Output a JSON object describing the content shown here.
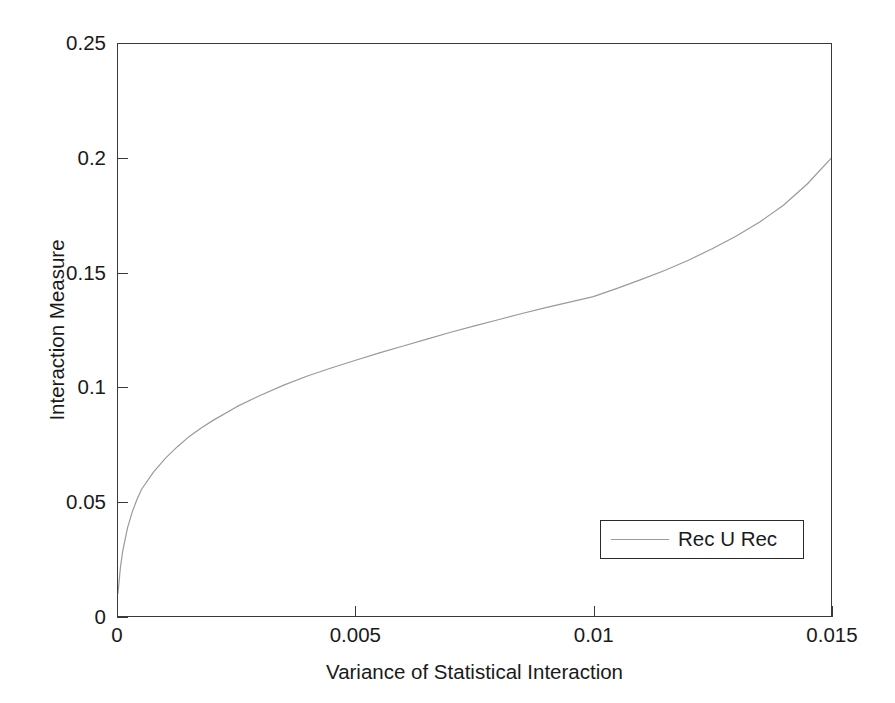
{
  "chart_data": {
    "type": "line",
    "title": "",
    "subtitle": "",
    "xlabel": "Variance of Statistical Interaction",
    "ylabel": "Interaction Measure",
    "xlim": [
      0,
      0.015
    ],
    "ylim": [
      0,
      0.25
    ],
    "xticks": [
      0,
      0.005,
      0.01,
      0.015
    ],
    "xticklabels": [
      "0",
      "0.005",
      "0.01",
      "0.015"
    ],
    "yticks": [
      0,
      0.05,
      0.1,
      0.15,
      0.2,
      0.25
    ],
    "yticklabels": [
      "0",
      "0.05",
      "0.1",
      "0.15",
      "0.2",
      "0.25"
    ],
    "grid": false,
    "legend_position": "lower right",
    "legend_entries": [
      "Rec U Rec"
    ],
    "series": [
      {
        "name": "Rec U Rec",
        "color": "#9a9a9a",
        "linewidth": 1.2,
        "x": [
          0.0,
          5e-05,
          0.0001,
          0.0002,
          0.0003,
          0.0004,
          0.0005,
          0.00075,
          0.001,
          0.00125,
          0.0015,
          0.00175,
          0.002,
          0.0025,
          0.003,
          0.0035,
          0.004,
          0.0045,
          0.005,
          0.0055,
          0.006,
          0.0065,
          0.007,
          0.0075,
          0.008,
          0.0085,
          0.009,
          0.0095,
          0.01,
          0.0105,
          0.011,
          0.0115,
          0.012,
          0.0125,
          0.013,
          0.0135,
          0.014,
          0.0145,
          0.015
        ],
        "y": [
          0.01,
          0.021,
          0.0285,
          0.0385,
          0.0455,
          0.051,
          0.0555,
          0.063,
          0.069,
          0.074,
          0.0785,
          0.0822,
          0.0855,
          0.0915,
          0.0965,
          0.101,
          0.105,
          0.1085,
          0.1118,
          0.115,
          0.118,
          0.121,
          0.124,
          0.1268,
          0.1295,
          0.1322,
          0.1348,
          0.1372,
          0.1396,
          0.1432,
          0.147,
          0.151,
          0.1555,
          0.1605,
          0.166,
          0.1722,
          0.1795,
          0.1888,
          0.2
        ]
      }
    ]
  },
  "axes": {
    "xlabel": "Variance of Statistical Interaction",
    "ylabel": "Interaction Measure"
  },
  "legend": {
    "items": [
      {
        "label": "Rec U Rec",
        "color": "#9a9a9a"
      }
    ]
  }
}
